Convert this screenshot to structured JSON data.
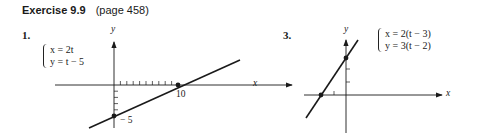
{
  "heading": {
    "title": "Exercise 9.9",
    "page": "(page 458)"
  },
  "problems": [
    {
      "number": "1.",
      "equations": [
        "x = 2t",
        "y = t − 5"
      ],
      "axis_labels": {
        "x": "x",
        "y": "y"
      },
      "tick_labels": {
        "x_intercept": "10",
        "y_intercept": "− 5"
      },
      "points": [
        [
          10,
          0
        ],
        [
          0,
          -5
        ]
      ]
    },
    {
      "number": "3.",
      "equations": [
        "x = 2(t − 3)",
        "y = 3(t − 2)"
      ],
      "axis_labels": {
        "x": "x",
        "y": "y"
      },
      "points": [
        [
          0,
          6
        ],
        [
          -4,
          0
        ]
      ]
    }
  ]
}
